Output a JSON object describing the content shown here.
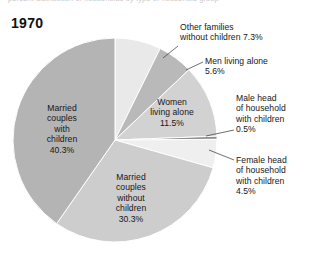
{
  "figure": {
    "clipped_caption": "percent distribution of households by type of household group",
    "year_title": "1970"
  },
  "chart_data": {
    "type": "pie",
    "title": "1970",
    "xlabel": "",
    "ylabel": "",
    "legend_position": "none",
    "grid": false,
    "start_angle_deg": 0,
    "direction": "clockwise",
    "units": "percent",
    "categories": [
      "Other families without children",
      "Men living alone",
      "Women living alone",
      "Male head of household with children",
      "Female head of household with children",
      "Married couples without children",
      "Married couples with children"
    ],
    "values": [
      7.3,
      5.6,
      11.5,
      0.5,
      4.5,
      30.3,
      40.3
    ],
    "slice_colors": [
      "#e9e9e9",
      "#b9b9b9",
      "#d2d2d2",
      "#8f8f8f",
      "#efefef",
      "#cdcdcd",
      "#b4b4b4"
    ],
    "slices": [
      {
        "name": "Other families without children",
        "value": 7.3,
        "label": "Other families\nwithout children 7.3%",
        "label_placement": "outside",
        "color": "#e9e9e9"
      },
      {
        "name": "Men living alone",
        "value": 5.6,
        "label": "Men living alone\n5.6%",
        "label_placement": "outside",
        "color": "#b9b9b9"
      },
      {
        "name": "Women living alone",
        "value": 11.5,
        "label": "Women\nliving alone\n11.5%",
        "label_placement": "inside",
        "color": "#d2d2d2"
      },
      {
        "name": "Male head of household with children",
        "value": 0.5,
        "label": "Male head\nof household\nwith children\n0.5%",
        "label_placement": "outside",
        "color": "#8f8f8f"
      },
      {
        "name": "Female head of household with children",
        "value": 4.5,
        "label": "Female head\nof household\nwith children\n4.5%",
        "label_placement": "outside",
        "color": "#efefef"
      },
      {
        "name": "Married couples without children",
        "value": 30.3,
        "label": "Married\ncouples\nwithout\nchildren\n30.3%",
        "label_placement": "inside",
        "color": "#cdcdcd"
      },
      {
        "name": "Married couples with children",
        "value": 40.3,
        "label": "Married\ncouples\nwith\nchildren\n40.3%",
        "label_placement": "inside",
        "color": "#b4b4b4"
      }
    ]
  },
  "labels": {
    "other_families": {
      "line1": "Other families",
      "line2": "without children 7.3%"
    },
    "men_alone": {
      "line1": "Men living alone",
      "line2": "5.6%"
    },
    "women_alone": {
      "line1": "Women",
      "line2": "living alone",
      "line3": "11.5%"
    },
    "male_head": {
      "line1": "Male head",
      "line2": "of household",
      "line3": "with children",
      "line4": "0.5%"
    },
    "female_head": {
      "line1": "Female head",
      "line2": "of household",
      "line3": "with children",
      "line4": "4.5%"
    },
    "married_without": {
      "line1": "Married",
      "line2": "couples",
      "line3": "without",
      "line4": "children",
      "line5": "30.3%"
    },
    "married_with": {
      "line1": "Married",
      "line2": "couples",
      "line3": "with",
      "line4": "children",
      "line5": "40.3%"
    }
  }
}
